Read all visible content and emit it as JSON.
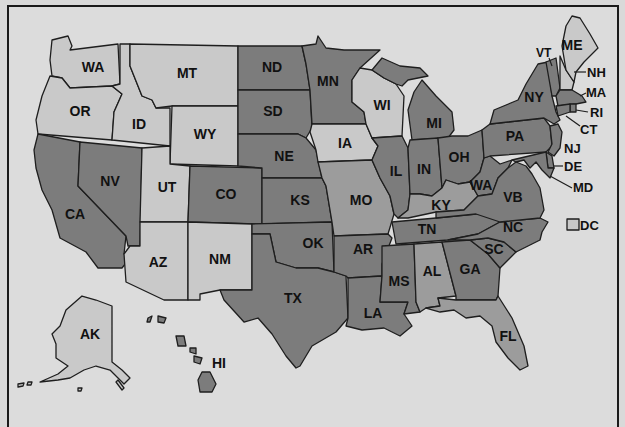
{
  "map": {
    "title": "",
    "colors": {
      "background": "#dcdcdc",
      "light": "#c9c9c9",
      "medium": "#9c9c9c",
      "dark": "#7c7c7c",
      "border": "#1e1e1e"
    },
    "states": {
      "WA": {
        "label": "WA",
        "shade": "light"
      },
      "OR": {
        "label": "OR",
        "shade": "light"
      },
      "CA": {
        "label": "CA",
        "shade": "dark"
      },
      "NV": {
        "label": "NV",
        "shade": "dark"
      },
      "ID": {
        "label": "ID",
        "shade": "light"
      },
      "MT": {
        "label": "MT",
        "shade": "light"
      },
      "WY": {
        "label": "WY",
        "shade": "light"
      },
      "UT": {
        "label": "UT",
        "shade": "light"
      },
      "AZ": {
        "label": "AZ",
        "shade": "light"
      },
      "CO": {
        "label": "CO",
        "shade": "dark"
      },
      "NM": {
        "label": "NM",
        "shade": "light"
      },
      "ND": {
        "label": "ND",
        "shade": "dark"
      },
      "SD": {
        "label": "SD",
        "shade": "dark"
      },
      "NE": {
        "label": "NE",
        "shade": "dark"
      },
      "KS": {
        "label": "KS",
        "shade": "dark"
      },
      "OK": {
        "label": "OK",
        "shade": "dark"
      },
      "TX": {
        "label": "TX",
        "shade": "dark"
      },
      "MN": {
        "label": "MN",
        "shade": "dark"
      },
      "IA": {
        "label": "IA",
        "shade": "light"
      },
      "MO": {
        "label": "MO",
        "shade": "medium"
      },
      "AR": {
        "label": "AR",
        "shade": "dark"
      },
      "LA": {
        "label": "LA",
        "shade": "dark"
      },
      "WI": {
        "label": "WI",
        "shade": "light"
      },
      "IL": {
        "label": "IL",
        "shade": "dark"
      },
      "MI": {
        "label": "MI",
        "shade": "dark"
      },
      "IN": {
        "label": "IN",
        "shade": "dark"
      },
      "OH": {
        "label": "OH",
        "shade": "dark"
      },
      "KY": {
        "label": "KY",
        "shade": "medium"
      },
      "TN": {
        "label": "TN",
        "shade": "dark"
      },
      "MS": {
        "label": "MS",
        "shade": "dark"
      },
      "AL": {
        "label": "AL",
        "shade": "medium"
      },
      "GA": {
        "label": "GA",
        "shade": "dark"
      },
      "FL": {
        "label": "FL",
        "shade": "medium"
      },
      "SC": {
        "label": "SC",
        "shade": "dark"
      },
      "NC": {
        "label": "NC",
        "shade": "dark"
      },
      "WV": {
        "label": "WA",
        "shade": "dark"
      },
      "VA": {
        "label": "VB",
        "shade": "dark"
      },
      "PA": {
        "label": "PA",
        "shade": "dark"
      },
      "NY": {
        "label": "NY",
        "shade": "dark"
      },
      "VT": {
        "label": "VT",
        "shade": "dark"
      },
      "NH": {
        "label": "NH",
        "shade": "light"
      },
      "ME": {
        "label": "ME",
        "shade": "light"
      },
      "MA": {
        "label": "MA",
        "shade": "dark"
      },
      "RI": {
        "label": "RI",
        "shade": "dark"
      },
      "CT": {
        "label": "CT",
        "shade": "dark"
      },
      "NJ": {
        "label": "NJ",
        "shade": "dark"
      },
      "DE": {
        "label": "DE",
        "shade": "dark"
      },
      "MD": {
        "label": "MD",
        "shade": "dark"
      },
      "AK": {
        "label": "AK",
        "shade": "light"
      },
      "HI": {
        "label": "HI",
        "shade": "dark"
      }
    },
    "legend": {
      "dc": {
        "label": "DC",
        "shade": "light"
      }
    }
  }
}
